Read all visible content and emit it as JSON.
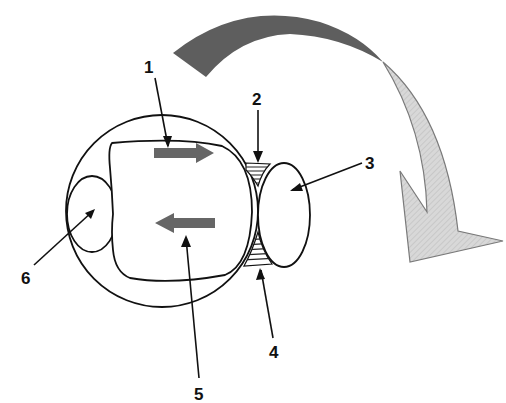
{
  "diagram": {
    "type": "cell-interaction-schematic",
    "labels": [
      {
        "id": "1",
        "text": "1",
        "x": 150,
        "y": 73,
        "points_to": "upper internal arrow (rightward)"
      },
      {
        "id": "2",
        "text": "2",
        "x": 258,
        "y": 105,
        "points_to": "upper hatched junction"
      },
      {
        "id": "3",
        "text": "3",
        "x": 370,
        "y": 169,
        "points_to": "right oval cell"
      },
      {
        "id": "4",
        "text": "4",
        "x": 275,
        "y": 358,
        "points_to": "lower hatched junction"
      },
      {
        "id": "5",
        "text": "5",
        "x": 200,
        "y": 400,
        "points_to": "lower internal arrow (leftward)"
      },
      {
        "id": "6",
        "text": "6",
        "x": 27,
        "y": 284,
        "points_to": "left small oval"
      }
    ],
    "arrows": {
      "internal_right": {
        "direction": "right",
        "color": "#666666"
      },
      "internal_left": {
        "direction": "left",
        "color": "#666666"
      },
      "curved_large": {
        "direction": "clockwise-down",
        "dark_color": "#5e5e5e",
        "light_color": "#d6d6d6"
      }
    },
    "colors": {
      "stroke": "#111111",
      "arrow_gray": "#666666",
      "curved_dark": "#5e5e5e",
      "curved_light": "#d6d6d6",
      "background": "#ffffff"
    }
  }
}
